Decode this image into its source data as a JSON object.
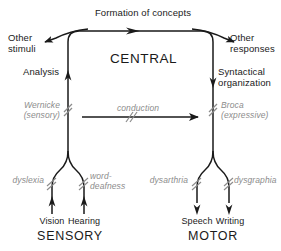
{
  "diagram": {
    "colors": {
      "line": "#1a1a1a",
      "text": "#1a1a1a",
      "lesion_label": "#8c8c8c",
      "background": "#ffffff"
    },
    "top": {
      "formation_label": "Formation of concepts",
      "other_stimuli": "Other\nstimuli",
      "other_responses": "Other\nresponses"
    },
    "center": {
      "central_label": "CENTRAL",
      "analysis_label": "Analysis",
      "syntactical_label": "Syntactical\norganization",
      "conduction_label": "conduction"
    },
    "areas": {
      "wernicke": "Wernicke\n(sensory)",
      "broca": "Broca\n(expressive)"
    },
    "lesions": {
      "dyslexia": "dyslexia",
      "word_deafness": "word-\ndeafness",
      "dysarthria": "dysarthria",
      "dysgraphia": "dysgraphia"
    },
    "modalities": {
      "vision": "Vision",
      "hearing": "Hearing",
      "speech": "Speech",
      "writing": "Writing"
    },
    "sections": {
      "sensory": "SENSORY",
      "motor": "MOTOR"
    }
  }
}
